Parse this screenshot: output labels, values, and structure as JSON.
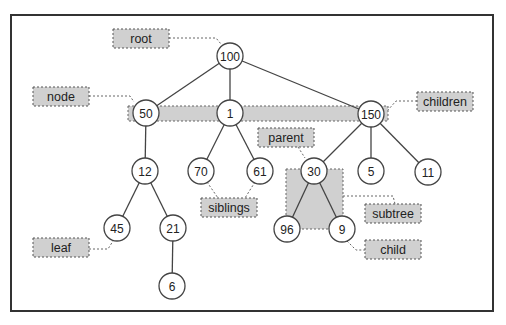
{
  "diagram": {
    "type": "tree",
    "colors": {
      "background": "#ffffff",
      "frame": "#333333",
      "node_stroke": "#444444",
      "node_fill": "#ffffff",
      "edge": "#444444",
      "label_fill": "#d0d0d0",
      "label_stroke": "#555555",
      "text": "#222222"
    },
    "frame": {
      "x": 11,
      "y": 15,
      "w": 482,
      "h": 296
    },
    "nodes": [
      {
        "id": "n100",
        "value": "100",
        "x": 230,
        "y": 56
      },
      {
        "id": "n50",
        "value": "50",
        "x": 146,
        "y": 113
      },
      {
        "id": "n1",
        "value": "1",
        "x": 230,
        "y": 113
      },
      {
        "id": "n150",
        "value": "150",
        "x": 371,
        "y": 114
      },
      {
        "id": "n12",
        "value": "12",
        "x": 145,
        "y": 171
      },
      {
        "id": "n70",
        "value": "70",
        "x": 201,
        "y": 171
      },
      {
        "id": "n61",
        "value": "61",
        "x": 260,
        "y": 171
      },
      {
        "id": "n30",
        "value": "30",
        "x": 314,
        "y": 171
      },
      {
        "id": "n5",
        "value": "5",
        "x": 371,
        "y": 171
      },
      {
        "id": "n11",
        "value": "11",
        "x": 428,
        "y": 172
      },
      {
        "id": "n45",
        "value": "45",
        "x": 117,
        "y": 228
      },
      {
        "id": "n21",
        "value": "21",
        "x": 173,
        "y": 228
      },
      {
        "id": "n96",
        "value": "96",
        "x": 287,
        "y": 229
      },
      {
        "id": "n9",
        "value": "9",
        "x": 342,
        "y": 229
      },
      {
        "id": "n6",
        "value": "6",
        "x": 172,
        "y": 286
      }
    ],
    "edges": [
      [
        "n100",
        "n50"
      ],
      [
        "n100",
        "n1"
      ],
      [
        "n100",
        "n150"
      ],
      [
        "n50",
        "n12"
      ],
      [
        "n1",
        "n70"
      ],
      [
        "n1",
        "n61"
      ],
      [
        "n150",
        "n30"
      ],
      [
        "n150",
        "n5"
      ],
      [
        "n150",
        "n11"
      ],
      [
        "n12",
        "n45"
      ],
      [
        "n12",
        "n21"
      ],
      [
        "n21",
        "n6"
      ],
      [
        "n30",
        "n96"
      ],
      [
        "n30",
        "n9"
      ]
    ],
    "labels": [
      {
        "id": "root",
        "text": "root",
        "x": 113,
        "y": 29,
        "w": 56,
        "h": 19
      },
      {
        "id": "node",
        "text": "node",
        "x": 33,
        "y": 87,
        "w": 56,
        "h": 19
      },
      {
        "id": "children",
        "text": "children",
        "x": 417,
        "y": 92,
        "w": 56,
        "h": 19
      },
      {
        "id": "parent",
        "text": "parent",
        "x": 258,
        "y": 128,
        "w": 56,
        "h": 19
      },
      {
        "id": "siblings",
        "text": "siblings",
        "x": 201,
        "y": 198,
        "w": 56,
        "h": 19
      },
      {
        "id": "subtree",
        "text": "subtree",
        "x": 365,
        "y": 204,
        "w": 56,
        "h": 19
      },
      {
        "id": "child",
        "text": "child",
        "x": 365,
        "y": 240,
        "w": 56,
        "h": 19
      },
      {
        "id": "leaf",
        "text": "leaf",
        "x": 33,
        "y": 238,
        "w": 56,
        "h": 19
      }
    ]
  }
}
